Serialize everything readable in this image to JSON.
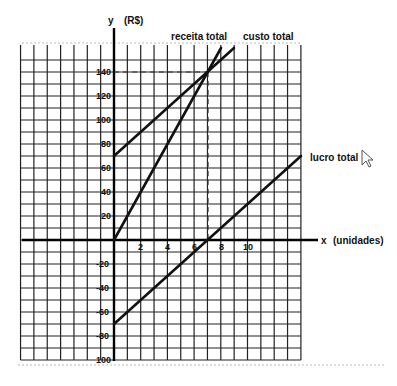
{
  "chart_data": {
    "type": "line",
    "title": "",
    "xlabel": "x (unidades)",
    "ylabel": "y (R$)",
    "xlim": [
      -7,
      14
    ],
    "ylim": [
      -100,
      160
    ],
    "grid": true,
    "x_ticks": [
      2,
      4,
      6,
      8,
      10
    ],
    "y_ticks": [
      140,
      120,
      100,
      80,
      60,
      40,
      20,
      -20,
      -40,
      -60,
      -80,
      -100
    ],
    "series": [
      {
        "name": "receita total",
        "equation": "y = 20x",
        "points": [
          [
            0,
            0
          ],
          [
            8,
            160
          ]
        ]
      },
      {
        "name": "custo total",
        "equation": "y = 70 + 10x",
        "points": [
          [
            0,
            70
          ],
          [
            9,
            160
          ]
        ]
      },
      {
        "name": "lucro total",
        "equation": "y = -70 + 10x",
        "points": [
          [
            0,
            -70
          ],
          [
            14,
            70
          ]
        ]
      }
    ],
    "annotations": [
      {
        "type": "dashed-hline",
        "y": 140,
        "from_x": 0,
        "to_x": 7
      },
      {
        "type": "dashed-vline",
        "x": 7,
        "from_y": 0,
        "to_y": 140
      },
      {
        "type": "break-even-point",
        "x": 7,
        "y": 140
      }
    ]
  },
  "labels": {
    "y_axis": "y",
    "y_unit": "(R$)",
    "x_axis": "x",
    "x_unit": "(unidades)",
    "receita": "receita total",
    "custo": "custo total",
    "lucro": "lucro total",
    "x2": "2",
    "x4": "4",
    "x6": "6",
    "x8": "8",
    "x10": "10",
    "y140": "140",
    "y120": "120",
    "y100": "100",
    "y80": "80",
    "y60": "60",
    "y40": "40",
    "y20": "20",
    "yn20": "-20",
    "yn40": "-40",
    "yn60": "-60",
    "yn80": "-80",
    "yn100": "100"
  },
  "icons": {
    "cursor": "mouse-pointer-icon"
  }
}
